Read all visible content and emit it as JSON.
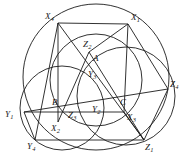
{
  "figure": {
    "width": 189,
    "height": 167,
    "stroke_color": "#1b1b1b",
    "background_color": "#ffffff",
    "line_width": 0.9
  },
  "circles": [
    {
      "name": "big-circle",
      "cx": 96,
      "cy": 77,
      "r": 73
    },
    {
      "name": "left-circle",
      "cx": 62,
      "cy": 108,
      "r": 42
    },
    {
      "name": "right-circle",
      "cx": 126,
      "cy": 96,
      "r": 49
    },
    {
      "name": "top-circle",
      "cx": 96,
      "cy": 80,
      "r": 46
    }
  ],
  "points": [
    {
      "name": "X1",
      "base": "X",
      "sub": "1",
      "x": 128,
      "y": 24,
      "label_x": 131,
      "label_y": 13
    },
    {
      "name": "X2",
      "base": "X",
      "sub": "2",
      "x": 58,
      "y": 122,
      "label_x": 51,
      "label_y": 124
    },
    {
      "name": "X3",
      "base": "X",
      "sub": "3",
      "x": 124,
      "y": 112,
      "label_x": 127,
      "label_y": 113
    },
    {
      "name": "X4",
      "base": "X",
      "sub": "4",
      "x": 58,
      "y": 23,
      "label_x": 45,
      "label_y": 12
    },
    {
      "name": "Y1",
      "base": "Y",
      "sub": "1",
      "x": 24,
      "y": 112,
      "label_x": 5,
      "label_y": 110
    },
    {
      "name": "Y2",
      "base": "Y",
      "sub": "2",
      "x": 97,
      "y": 110,
      "label_x": 92,
      "label_y": 105
    },
    {
      "name": "Y3",
      "base": "Y",
      "sub": "3",
      "x": 93,
      "y": 76,
      "label_x": 88,
      "label_y": 70
    },
    {
      "name": "Y4",
      "base": "Y",
      "sub": "4",
      "x": 35,
      "y": 140,
      "label_x": 27,
      "label_y": 142
    },
    {
      "name": "Z1",
      "base": "Z",
      "sub": "1",
      "x": 144,
      "y": 140,
      "label_x": 145,
      "label_y": 143
    },
    {
      "name": "Z2",
      "base": "Z",
      "sub": "2",
      "x": 89,
      "y": 52,
      "label_x": 83,
      "label_y": 40
    },
    {
      "name": "Z3",
      "base": "Z",
      "sub": "3",
      "x": 72,
      "y": 114,
      "label_x": 68,
      "label_y": 111
    },
    {
      "name": "Z4",
      "base": "Z",
      "sub": "4",
      "x": 168,
      "y": 89,
      "label_x": 170,
      "label_y": 80
    },
    {
      "name": "A",
      "base": "A",
      "sub": "",
      "x": 96,
      "y": 60,
      "label_x": 93,
      "label_y": 54
    },
    {
      "name": "B",
      "base": "B",
      "sub": "",
      "x": 59,
      "y": 103,
      "label_x": 52,
      "label_y": 98
    },
    {
      "name": "C",
      "base": "C",
      "sub": "",
      "x": 124,
      "y": 103,
      "label_x": 120,
      "label_y": 98
    }
  ],
  "segments": [
    {
      "name": "seg-X4-X1",
      "from": "X4",
      "to": "X1"
    },
    {
      "name": "seg-X4-Y4",
      "from": "X4",
      "to": "Y4"
    },
    {
      "name": "seg-X4-X2",
      "from": "X4",
      "to": "X2"
    },
    {
      "name": "seg-X4-Z1",
      "from": "X4",
      "to": "Z1"
    },
    {
      "name": "seg-X1-Z2",
      "from": "X1",
      "to": "Z2"
    },
    {
      "name": "seg-X1-Z4",
      "from": "X1",
      "to": "Z4"
    },
    {
      "name": "seg-X1-X3",
      "from": "X1",
      "to": "X3"
    },
    {
      "name": "seg-Z2-X2",
      "from": "Z2",
      "to": "X2"
    },
    {
      "name": "seg-Z2-Z1",
      "from": "Z2",
      "to": "Z1"
    },
    {
      "name": "seg-Y1-Z4",
      "from": "Y1",
      "to": "Z4"
    },
    {
      "name": "seg-Y1-Y4",
      "from": "Y1",
      "to": "Y4"
    },
    {
      "name": "seg-Y1-X3",
      "from": "Y1",
      "to": "X3"
    },
    {
      "name": "seg-Y4-Z1",
      "from": "Y4",
      "to": "Z1"
    },
    {
      "name": "seg-Z1-Z4",
      "from": "Z1",
      "to": "Z4"
    },
    {
      "name": "seg-X3-Z1",
      "from": "X3",
      "to": "Z1"
    }
  ]
}
